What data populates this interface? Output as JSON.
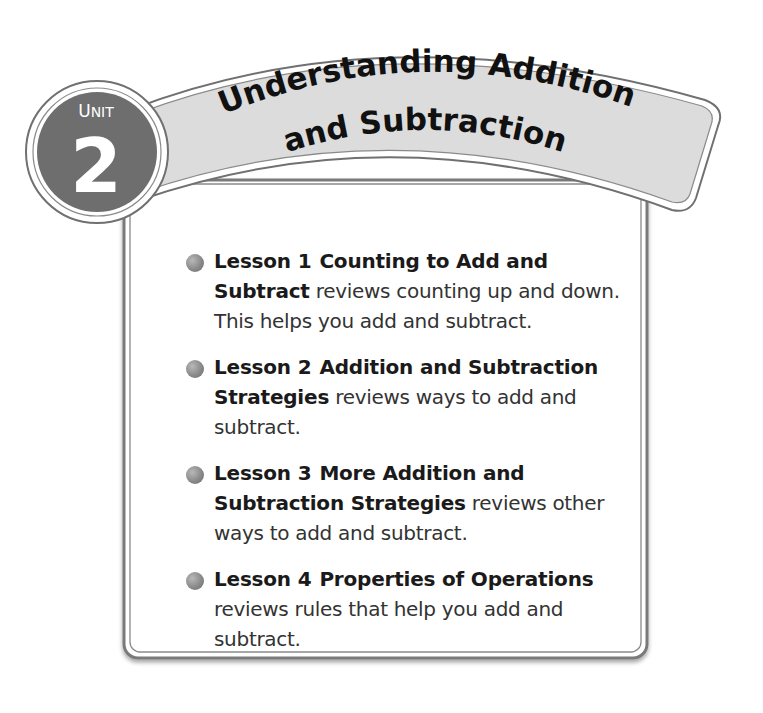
{
  "unit": {
    "label": "UNIT",
    "number": "2",
    "title_line1": "Understanding Addition",
    "title_line2": "and Subtraction"
  },
  "colors": {
    "circle_fill": "#6e6e6e",
    "banner_fill": "#dcdcdc",
    "outline": "#777777",
    "bullet": "#8a8a8a"
  },
  "lessons": [
    {
      "prefix": "Lesson 1",
      "title": "Counting to Add and Subtract",
      "description": "reviews counting up and down. This helps you add and subtract."
    },
    {
      "prefix": "Lesson 2",
      "title": "Addition and Subtraction Strategies",
      "description": "reviews ways to add and subtract."
    },
    {
      "prefix": "Lesson 3",
      "title": "More Addition and Subtraction Strategies",
      "description": "reviews other ways to add and subtract."
    },
    {
      "prefix": "Lesson 4",
      "title": "Properties of Operations",
      "description": "reviews rules that help you add and subtract."
    }
  ]
}
